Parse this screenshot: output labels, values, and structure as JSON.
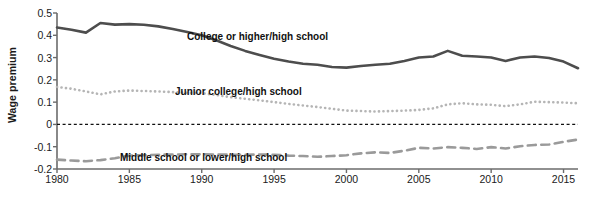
{
  "axes": {
    "ylabel": "Wage premium",
    "yticks": [
      "0.5",
      "0.4",
      "0.3",
      "0.2",
      "0.1",
      "0",
      "-0.1",
      "-0.2"
    ],
    "ytick_values": [
      0.5,
      0.4,
      0.3,
      0.2,
      0.1,
      0,
      -0.1,
      -0.2
    ],
    "xticks": [
      "1980",
      "1985",
      "1990",
      "1995",
      "2000",
      "2005",
      "2010",
      "2015"
    ],
    "xtick_values": [
      1980,
      1985,
      1990,
      1995,
      2000,
      2005,
      2010,
      2015
    ]
  },
  "labels": {
    "college": "College or higher/high school",
    "junior": "Junior college/high school",
    "middle": "Middle school or lower/high school"
  },
  "colors": {
    "college": "#4d4d4d",
    "junior": "#b5b5b5",
    "middle": "#9a9a9a",
    "zeroline": "#111111",
    "axis": "#6b6b6b",
    "text": "#1a1a1a"
  },
  "chart_data": {
    "type": "line",
    "title": "",
    "xlabel": "",
    "ylabel": "Wage premium",
    "xlim": [
      1980,
      2016
    ],
    "ylim": [
      -0.2,
      0.5
    ],
    "grid": false,
    "legend": "inline-annotations",
    "zero_reference_line": 0,
    "x": [
      1980,
      1981,
      1982,
      1983,
      1984,
      1985,
      1986,
      1987,
      1988,
      1989,
      1990,
      1991,
      1992,
      1993,
      1994,
      1995,
      1996,
      1997,
      1998,
      1999,
      2000,
      2001,
      2002,
      2003,
      2004,
      2005,
      2006,
      2007,
      2008,
      2009,
      2010,
      2011,
      2012,
      2013,
      2014,
      2015,
      2016
    ],
    "series": [
      {
        "name": "College or higher/high school",
        "style": "solid",
        "color": "#4d4d4d",
        "values": [
          0.435,
          0.425,
          0.412,
          0.455,
          0.448,
          0.45,
          0.447,
          0.44,
          0.428,
          0.415,
          0.4,
          0.378,
          0.352,
          0.33,
          0.312,
          0.295,
          0.282,
          0.272,
          0.268,
          0.258,
          0.255,
          0.262,
          0.268,
          0.272,
          0.285,
          0.3,
          0.305,
          0.33,
          0.308,
          0.305,
          0.3,
          0.285,
          0.3,
          0.305,
          0.298,
          0.282,
          0.252
        ]
      },
      {
        "name": "Junior college/high school",
        "style": "dotted",
        "color": "#b5b5b5",
        "values": [
          0.168,
          0.16,
          0.148,
          0.135,
          0.148,
          0.152,
          0.15,
          0.148,
          0.145,
          0.142,
          0.14,
          0.132,
          0.122,
          0.115,
          0.108,
          0.1,
          0.092,
          0.085,
          0.078,
          0.07,
          0.062,
          0.06,
          0.058,
          0.06,
          0.062,
          0.065,
          0.072,
          0.09,
          0.095,
          0.09,
          0.088,
          0.082,
          0.09,
          0.102,
          0.1,
          0.098,
          0.095
        ]
      },
      {
        "name": "Middle school or lower/high school",
        "style": "dashed",
        "color": "#9a9a9a",
        "values": [
          -0.158,
          -0.162,
          -0.165,
          -0.16,
          -0.152,
          -0.14,
          -0.138,
          -0.136,
          -0.135,
          -0.134,
          -0.134,
          -0.135,
          -0.136,
          -0.136,
          -0.135,
          -0.136,
          -0.14,
          -0.142,
          -0.145,
          -0.142,
          -0.138,
          -0.13,
          -0.125,
          -0.128,
          -0.118,
          -0.105,
          -0.108,
          -0.102,
          -0.105,
          -0.11,
          -0.102,
          -0.108,
          -0.098,
          -0.092,
          -0.09,
          -0.078,
          -0.068
        ]
      }
    ]
  },
  "annotations": [
    {
      "text": "College or higher/high school",
      "x": 187,
      "y": 31
    },
    {
      "text": "Junior college/high school",
      "x": 175,
      "y": 86
    },
    {
      "text": "Middle school or lower/high school",
      "x": 120,
      "y": 152
    }
  ]
}
